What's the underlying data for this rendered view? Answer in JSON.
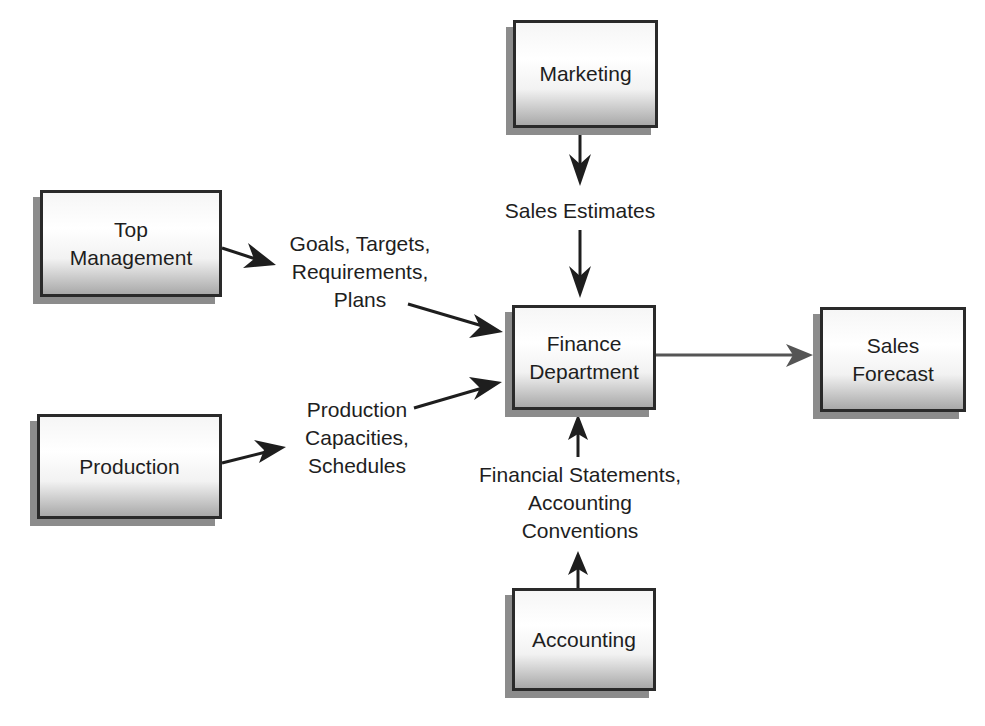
{
  "diagram": {
    "nodes": {
      "marketing": "Marketing",
      "top_management": "Top\nManagement",
      "finance": "Finance\nDepartment",
      "sales_forecast": "Sales\nForecast",
      "production": "Production",
      "accounting": "Accounting"
    },
    "edge_labels": {
      "sales_estimates": "Sales Estimates",
      "goals": "Goals, Targets,\nRequirements,\nPlans",
      "production_capacities": "Production\nCapacities,\nSchedules",
      "financial_statements": "Financial Statements,\nAccounting\nConventions"
    },
    "edges": [
      {
        "from": "Marketing",
        "to": "Finance Department",
        "label": "Sales Estimates"
      },
      {
        "from": "Top Management",
        "to": "Finance Department",
        "label": "Goals, Targets, Requirements, Plans"
      },
      {
        "from": "Production",
        "to": "Finance Department",
        "label": "Production Capacities, Schedules"
      },
      {
        "from": "Accounting",
        "to": "Finance Department",
        "label": "Financial Statements, Accounting Conventions"
      },
      {
        "from": "Finance Department",
        "to": "Sales Forecast",
        "label": ""
      }
    ],
    "colors": {
      "border": "#2a2a2a",
      "shadow": "#8c8c8c",
      "arrow_dark": "#1e1e1e",
      "arrow_gray": "#555555"
    }
  }
}
